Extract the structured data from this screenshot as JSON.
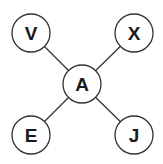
{
  "diagram": {
    "center": {
      "id": "A",
      "label": "A",
      "cx": 82,
      "cy": 84
    },
    "nodes": [
      {
        "id": "V",
        "label": "V",
        "cx": 31,
        "cy": 33
      },
      {
        "id": "X",
        "label": "X",
        "cx": 134,
        "cy": 33
      },
      {
        "id": "E",
        "label": "E",
        "cx": 31,
        "cy": 135
      },
      {
        "id": "J",
        "label": "J",
        "cx": 134,
        "cy": 135
      }
    ],
    "edges": [
      [
        "A",
        "V"
      ],
      [
        "A",
        "X"
      ],
      [
        "A",
        "E"
      ],
      [
        "A",
        "J"
      ]
    ],
    "radius": 19,
    "stroke_color": "#333333"
  }
}
